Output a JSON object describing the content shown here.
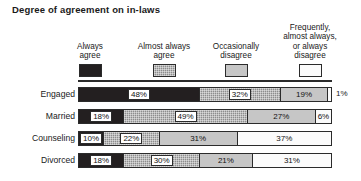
{
  "title": "Degree of agreement on in-laws",
  "legend": [
    {
      "lines": [
        "Always",
        "agree"
      ],
      "swatch": "dark",
      "swatch_color": "#231f20",
      "center": 12
    },
    {
      "lines": [
        "Almost always",
        "agree"
      ],
      "swatch": "med",
      "swatch_color": "#8d8d8d",
      "center": 86
    },
    {
      "lines": [
        "Occasionally",
        "disagree"
      ],
      "swatch": "light",
      "swatch_color": "#c6c6c6",
      "center": 158
    },
    {
      "lines": [
        "Frequently,",
        "almost always,",
        "or always",
        "disagree"
      ],
      "swatch": "white",
      "swatch_color": "#fbfbfb",
      "center": 232
    }
  ],
  "chart_data": {
    "type": "bar",
    "subtype": "stacked-horizontal-100",
    "title": "Degree of agreement on in-laws",
    "xlabel": "",
    "ylabel": "",
    "xlim": [
      0,
      100
    ],
    "grid": false,
    "legend_position": "top",
    "categories": [
      "Engaged",
      "Married",
      "Counseling",
      "Divorced"
    ],
    "series": [
      {
        "name": "Always agree",
        "color": "#231f20",
        "values": [
          48,
          18,
          10,
          18
        ]
      },
      {
        "name": "Almost always agree",
        "color": "#8d8d8d",
        "values": [
          32,
          49,
          22,
          30
        ]
      },
      {
        "name": "Occasionally disagree",
        "color": "#c6c6c6",
        "values": [
          19,
          27,
          31,
          21
        ]
      },
      {
        "name": "Frequently, almost always, or always disagree",
        "color": "#fbfbfb",
        "values": [
          1,
          6,
          37,
          31
        ]
      }
    ]
  },
  "rows": [
    {
      "label": "Engaged",
      "outside_value": "1%",
      "segments": [
        {
          "value": 48,
          "text": "48%",
          "fill": "dark",
          "show": true
        },
        {
          "value": 32,
          "text": "32%",
          "fill": "med",
          "show": true
        },
        {
          "value": 19,
          "text": "19%",
          "fill": "light",
          "show": true
        },
        {
          "value": 1,
          "text": "1%",
          "fill": "white",
          "show": false
        }
      ]
    },
    {
      "label": "Married",
      "outside_value": "",
      "segments": [
        {
          "value": 18,
          "text": "18%",
          "fill": "dark",
          "show": true
        },
        {
          "value": 49,
          "text": "49%",
          "fill": "med",
          "show": true
        },
        {
          "value": 27,
          "text": "27%",
          "fill": "light",
          "show": true
        },
        {
          "value": 6,
          "text": "6%",
          "fill": "white",
          "show": true
        }
      ]
    },
    {
      "label": "Counseling",
      "outside_value": "",
      "segments": [
        {
          "value": 10,
          "text": "10%",
          "fill": "dark",
          "show": true
        },
        {
          "value": 22,
          "text": "22%",
          "fill": "med",
          "show": true
        },
        {
          "value": 31,
          "text": "31%",
          "fill": "light",
          "show": true
        },
        {
          "value": 37,
          "text": "37%",
          "fill": "white",
          "show": true
        }
      ]
    },
    {
      "label": "Divorced",
      "outside_value": "",
      "segments": [
        {
          "value": 18,
          "text": "18%",
          "fill": "dark",
          "show": true
        },
        {
          "value": 30,
          "text": "30%",
          "fill": "med",
          "show": true
        },
        {
          "value": 21,
          "text": "21%",
          "fill": "light",
          "show": true
        },
        {
          "value": 31,
          "text": "31%",
          "fill": "white",
          "show": true
        }
      ]
    }
  ]
}
